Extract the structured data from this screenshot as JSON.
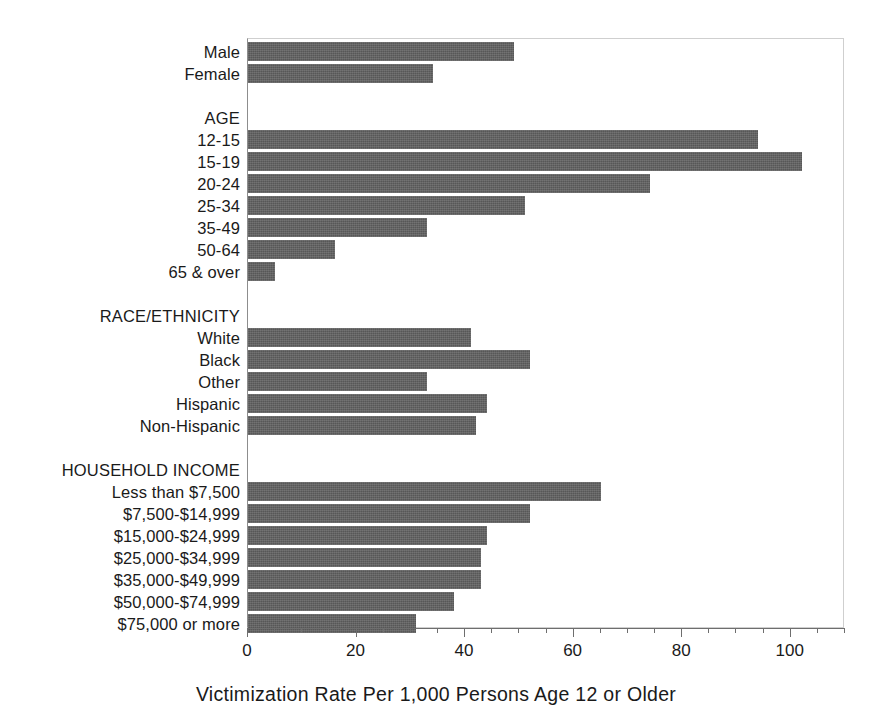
{
  "chart_data": {
    "type": "bar",
    "orientation": "horizontal",
    "title": "",
    "xlabel": "Victimization Rate Per 1,000 Persons Age 12 or Older",
    "ylabel": "",
    "xlim": [
      0,
      110
    ],
    "xticks": [
      0,
      20,
      40,
      60,
      80,
      100
    ],
    "xtick_labels": [
      "0",
      "20",
      "40",
      "60",
      "80",
      "100"
    ],
    "minor_tick_step": 5,
    "grid": false,
    "legend": false,
    "bar_color": "#575757",
    "rows": [
      {
        "label": "Male",
        "value": 49,
        "group": false
      },
      {
        "label": "Female",
        "value": 34,
        "group": false
      },
      {
        "label": "",
        "value": null,
        "group": false
      },
      {
        "label": "AGE",
        "value": null,
        "group": true
      },
      {
        "label": "12-15",
        "value": 94,
        "group": false
      },
      {
        "label": "15-19",
        "value": 102,
        "group": false
      },
      {
        "label": "20-24",
        "value": 74,
        "group": false
      },
      {
        "label": "25-34",
        "value": 51,
        "group": false
      },
      {
        "label": "35-49",
        "value": 33,
        "group": false
      },
      {
        "label": "50-64",
        "value": 16,
        "group": false
      },
      {
        "label": "65 & over",
        "value": 5,
        "group": false
      },
      {
        "label": "",
        "value": null,
        "group": false
      },
      {
        "label": "RACE/ETHNICITY",
        "value": null,
        "group": true
      },
      {
        "label": "White",
        "value": 41,
        "group": false
      },
      {
        "label": "Black",
        "value": 52,
        "group": false
      },
      {
        "label": "Other",
        "value": 33,
        "group": false
      },
      {
        "label": "Hispanic",
        "value": 44,
        "group": false
      },
      {
        "label": "Non-Hispanic",
        "value": 42,
        "group": false
      },
      {
        "label": "",
        "value": null,
        "group": false
      },
      {
        "label": "HOUSEHOLD INCOME",
        "value": null,
        "group": true
      },
      {
        "label": "Less than $7,500",
        "value": 65,
        "group": false
      },
      {
        "label": "$7,500-$14,999",
        "value": 52,
        "group": false
      },
      {
        "label": "$15,000-$24,999",
        "value": 44,
        "group": false
      },
      {
        "label": "$25,000-$34,999",
        "value": 43,
        "group": false
      },
      {
        "label": "$35,000-$49,999",
        "value": 43,
        "group": false
      },
      {
        "label": "$50,000-$74,999",
        "value": 38,
        "group": false
      },
      {
        "label": "$75,000 or more",
        "value": 31,
        "group": false
      }
    ]
  }
}
